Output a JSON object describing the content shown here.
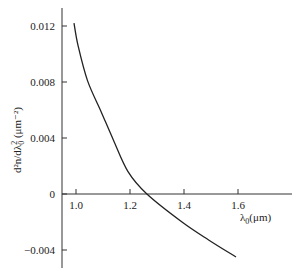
{
  "chart_data": {
    "type": "line",
    "title": "",
    "xlabel": "λ0(μm)",
    "ylabel": "d²n/dλ0² (μm⁻²)",
    "xlim": [
      0.95,
      1.8
    ],
    "ylim": [
      -0.0053,
      0.0133
    ],
    "grid": false,
    "legend": null,
    "x_ticks": [
      1.0,
      1.2,
      1.4,
      1.6
    ],
    "x_tick_labels": [
      "1.0",
      "1.2",
      "1.4",
      "1.6"
    ],
    "y_ticks": [
      -0.004,
      0,
      0.004,
      0.008,
      0.012
    ],
    "y_tick_labels": [
      "−0.004",
      "0",
      "0.004",
      "0.008",
      "0.012"
    ],
    "series": [
      {
        "name": "d2n/dlambda2",
        "x": [
          1.0,
          1.015,
          1.05,
          1.1,
          1.145,
          1.2,
          1.27,
          1.4,
          1.5,
          1.6
        ],
        "y": [
          0.0122,
          0.0106,
          0.0081,
          0.0059,
          0.0039,
          0.0016,
          0.0,
          -0.002,
          -0.0033,
          -0.0045
        ]
      }
    ],
    "annotations": []
  },
  "layout": {
    "x_axis_label": "λ",
    "x_axis_label_sub": "0",
    "x_axis_label_unit": "(μm)",
    "y_axis_label_main": "d²n/dλ",
    "y_axis_label_sub": "0",
    "y_axis_label_sup": "2",
    "y_axis_label_unit": " (μm⁻²)"
  }
}
